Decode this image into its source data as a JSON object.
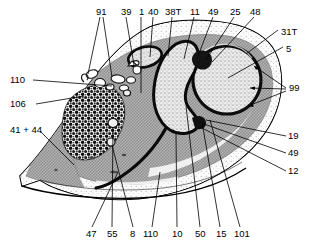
{
  "figure": {
    "kind": "anatomical-cross-section",
    "region": "shoulder-transverse-section",
    "background_color": "#ffffff",
    "ink_color": "#000000",
    "muscle_fill": "#a8a8a8",
    "bone_fill": "#e8e8e8",
    "cortex_color": "#111111"
  },
  "labels": {
    "top": [
      {
        "id": "l91",
        "text": "91",
        "x": 96,
        "y": 7
      },
      {
        "id": "l39",
        "text": "39",
        "x": 121,
        "y": 7
      },
      {
        "id": "l1",
        "text": "1",
        "x": 139,
        "y": 7
      },
      {
        "id": "l40",
        "text": "40",
        "x": 148,
        "y": 7
      },
      {
        "id": "l38T",
        "text": "38T",
        "x": 165,
        "y": 7
      },
      {
        "id": "l11",
        "text": "11",
        "x": 190,
        "y": 7
      },
      {
        "id": "l49t",
        "text": "49",
        "x": 208,
        "y": 7
      },
      {
        "id": "l25",
        "text": "25",
        "x": 230,
        "y": 7
      },
      {
        "id": "l48",
        "text": "48",
        "x": 250,
        "y": 7
      }
    ],
    "right": [
      {
        "id": "l31T",
        "text": "31T",
        "x": 281,
        "y": 27
      },
      {
        "id": "l5",
        "text": "5",
        "x": 286,
        "y": 44
      },
      {
        "id": "l99",
        "text": "99",
        "x": 289,
        "y": 88
      },
      {
        "id": "l19",
        "text": "19",
        "x": 288,
        "y": 134
      },
      {
        "id": "l49r",
        "text": "49",
        "x": 288,
        "y": 151
      },
      {
        "id": "l12",
        "text": "12",
        "x": 288,
        "y": 169
      }
    ],
    "left": [
      {
        "id": "l110l",
        "text": "110",
        "x": 10,
        "y": 78
      },
      {
        "id": "l106",
        "text": "106",
        "x": 10,
        "y": 101
      },
      {
        "id": "l41_44",
        "text": "41 + 44",
        "x": 10,
        "y": 126
      }
    ],
    "bottom": [
      {
        "id": "l47",
        "text": "47",
        "x": 86,
        "y": 231
      },
      {
        "id": "l55",
        "text": "55",
        "x": 107,
        "y": 231
      },
      {
        "id": "l8",
        "text": "8",
        "x": 130,
        "y": 231
      },
      {
        "id": "l110b",
        "text": "110",
        "x": 143,
        "y": 231
      },
      {
        "id": "l10",
        "text": "10",
        "x": 172,
        "y": 231
      },
      {
        "id": "l50",
        "text": "50",
        "x": 195,
        "y": 231
      },
      {
        "id": "l15",
        "text": "15",
        "x": 216,
        "y": 231
      },
      {
        "id": "l101",
        "text": "101",
        "x": 234,
        "y": 231
      }
    ]
  }
}
